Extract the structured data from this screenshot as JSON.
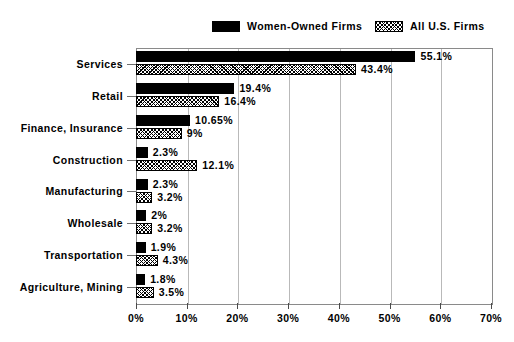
{
  "chart_data": {
    "type": "bar",
    "orientation": "horizontal",
    "title": "",
    "xlabel": "",
    "ylabel": "",
    "xlim": [
      0,
      70
    ],
    "xticks": [
      "0%",
      "10%",
      "20%",
      "30%",
      "40%",
      "50%",
      "60%",
      "70%"
    ],
    "xtick_values": [
      0,
      10,
      20,
      30,
      40,
      50,
      60,
      70
    ],
    "grid": true,
    "grid_axis": "x",
    "legend_position": "top",
    "categories": [
      "Services",
      "Retail",
      "Finance, Insurance",
      "Construction",
      "Manufacturing",
      "Wholesale",
      "Transportation",
      "Agriculture, Mining"
    ],
    "series": [
      {
        "name": "Women-Owned Firms",
        "swatch": "solid-black",
        "color": "#000000",
        "values": [
          55.1,
          19.4,
          10.65,
          2.3,
          2.3,
          2.0,
          1.9,
          1.8
        ],
        "labels": [
          "55.1%",
          "19.4%",
          "10.65%",
          "2.3%",
          "2.3%",
          "2%",
          "1.9%",
          "1.8%"
        ]
      },
      {
        "name": "All U.S. Firms",
        "swatch": "diagonal-hatch",
        "color": "#ffffff",
        "values": [
          43.4,
          16.4,
          9.0,
          12.1,
          3.2,
          3.2,
          4.3,
          3.5
        ],
        "labels": [
          "43.4%",
          "16.4%",
          "9%",
          "12.1%",
          "3.2%",
          "3.2%",
          "4.3%",
          "3.5%"
        ]
      }
    ]
  },
  "legend": {
    "items": [
      {
        "label": "Women-Owned Firms",
        "swatch": "solid-black"
      },
      {
        "label": "All U.S. Firms",
        "swatch": "diagonal-hatch"
      }
    ]
  }
}
